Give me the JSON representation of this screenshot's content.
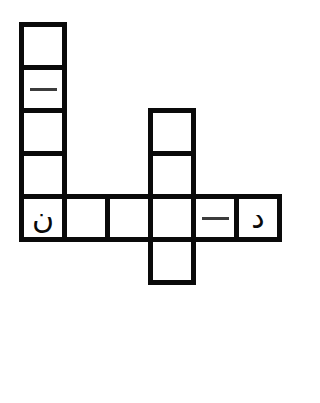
{
  "puzzle": {
    "kind": "crossword-grid",
    "background_color": "#ffffff",
    "cell_border_color": "#0a0a0a",
    "cell_fill_color": "#ffffff",
    "glyph_color": "#0a0a0a",
    "dash_color": "#3c3c3c",
    "cell_size": 48,
    "border_width": 5,
    "origin_x": 19,
    "origin_y": 22,
    "columns": 6,
    "rows": 6,
    "cells": [
      {
        "id": "cell-c0r0",
        "col": 0,
        "row": 0,
        "content": "",
        "content_type": "empty"
      },
      {
        "id": "cell-c0r1",
        "col": 0,
        "row": 1,
        "content": "—",
        "content_type": "dash"
      },
      {
        "id": "cell-c0r2",
        "col": 0,
        "row": 2,
        "content": "",
        "content_type": "empty"
      },
      {
        "id": "cell-c0r3",
        "col": 0,
        "row": 3,
        "content": "",
        "content_type": "empty"
      },
      {
        "id": "cell-c0r4",
        "col": 0,
        "row": 4,
        "content": "ن",
        "content_type": "letter"
      },
      {
        "id": "cell-c1r4",
        "col": 1,
        "row": 4,
        "content": "",
        "content_type": "empty"
      },
      {
        "id": "cell-c2r4",
        "col": 2,
        "row": 4,
        "content": "",
        "content_type": "empty"
      },
      {
        "id": "cell-c3r2",
        "col": 3,
        "row": 2,
        "content": "",
        "content_type": "empty"
      },
      {
        "id": "cell-c3r3",
        "col": 3,
        "row": 3,
        "content": "",
        "content_type": "empty"
      },
      {
        "id": "cell-c3r4",
        "col": 3,
        "row": 4,
        "content": "",
        "content_type": "empty"
      },
      {
        "id": "cell-c3r5",
        "col": 3,
        "row": 5,
        "content": "",
        "content_type": "empty"
      },
      {
        "id": "cell-c4r4",
        "col": 4,
        "row": 4,
        "content": "—",
        "content_type": "dash"
      },
      {
        "id": "cell-c5r4",
        "col": 5,
        "row": 4,
        "content": "د",
        "content_type": "letter"
      }
    ]
  }
}
